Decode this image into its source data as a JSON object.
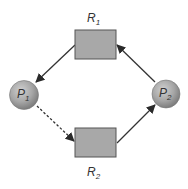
{
  "diagram": {
    "type": "resource-allocation-graph",
    "colors": {
      "resource_fill": "#a8a8a8",
      "resource_stroke": "#555555",
      "process_fill": "#a6a6a6",
      "edge": "#333333",
      "label": "#333333"
    },
    "resources": [
      {
        "id": "R1",
        "label": "R",
        "subscript": "1"
      },
      {
        "id": "R2",
        "label": "R",
        "subscript": "2"
      }
    ],
    "processes": [
      {
        "id": "P1",
        "label": "P",
        "subscript": "1"
      },
      {
        "id": "P2",
        "label": "P",
        "subscript": "2"
      }
    ],
    "edges": [
      {
        "from": "R1",
        "to": "P1",
        "kind": "assignment",
        "style": "solid"
      },
      {
        "from": "P1",
        "to": "R2",
        "kind": "claim",
        "style": "dashed"
      },
      {
        "from": "R2",
        "to": "P2",
        "kind": "assignment",
        "style": "solid"
      },
      {
        "from": "P2",
        "to": "R1",
        "kind": "request",
        "style": "solid"
      }
    ]
  }
}
